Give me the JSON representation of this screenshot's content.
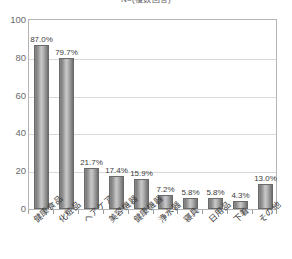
{
  "chart_data": {
    "type": "bar",
    "title": "N=(複数回答)",
    "xlabel": "",
    "ylabel": "",
    "ylim": [
      0,
      100
    ],
    "yticks": [
      0,
      20,
      40,
      60,
      80,
      100
    ],
    "ytick_labels": [
      "0",
      "20",
      "40",
      "60",
      "80",
      "100"
    ],
    "grid": true,
    "legend": "none",
    "unit": "%",
    "categories": [
      "健康食品",
      "化粧品",
      "ヘアケア",
      "美容機器",
      "健康機器",
      "浄水器",
      "寝具",
      "日用品",
      "下着",
      "その他"
    ],
    "values": [
      87.0,
      79.7,
      21.7,
      17.4,
      15.9,
      7.2,
      5.8,
      5.8,
      4.3,
      13.0
    ],
    "data_labels": [
      "87.0%",
      "79.7%",
      "21.7%",
      "17.4%",
      "15.9%",
      "7.2%",
      "5.8%",
      "5.8%",
      "4.3%",
      "13.0%"
    ],
    "colors": {
      "bar_fill_light": "#c9c9c9",
      "bar_fill_dark": "#6f6f6f",
      "bar_border": "#6a6a6a",
      "gridline": "#d9d9d9",
      "axis": "#b5b5b5",
      "tick_text": "#6b6b6b",
      "label_text": "#3c3c3c",
      "background": "#ffffff"
    }
  }
}
